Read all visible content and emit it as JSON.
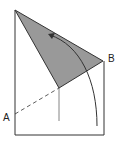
{
  "diagram": {
    "labels": {
      "a": "A",
      "b": "B"
    },
    "colors": {
      "fill": "#999999",
      "stroke": "#333333"
    }
  }
}
